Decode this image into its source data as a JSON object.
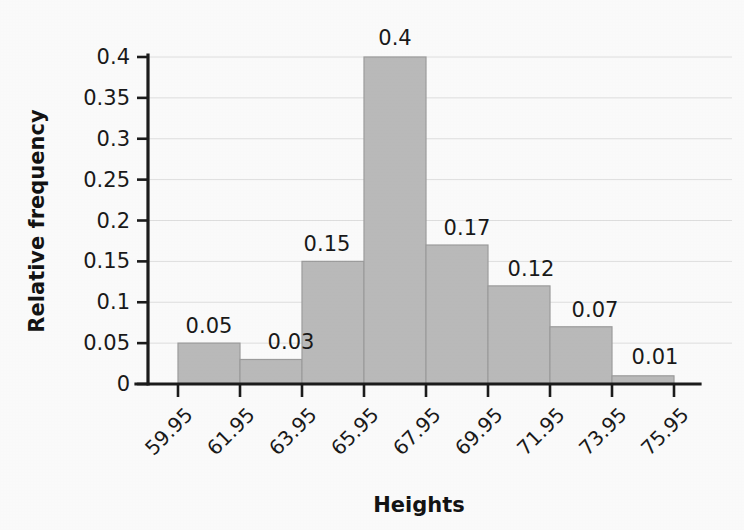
{
  "chart_data": {
    "type": "bar",
    "title": "",
    "xlabel": "Heights",
    "ylabel": "Relative frequency",
    "categories": [
      "59.95-61.95",
      "61.95-63.95",
      "63.95-65.95",
      "65.95-67.95",
      "67.95-69.95",
      "69.95-71.95",
      "71.95-73.95",
      "73.95-75.95"
    ],
    "bin_edges": [
      "59.95",
      "61.95",
      "63.95",
      "65.95",
      "67.95",
      "69.95",
      "71.95",
      "73.95",
      "75.95"
    ],
    "values": [
      0.05,
      0.03,
      0.15,
      0.4,
      0.17,
      0.12,
      0.07,
      0.01
    ],
    "value_labels": [
      "0.05",
      "0.03",
      "0.15",
      "0.4",
      "0.17",
      "0.12",
      "0.07",
      "0.01"
    ],
    "ylim": [
      0,
      0.4
    ],
    "yticks": [
      0,
      0.05,
      0.1,
      0.15,
      0.2,
      0.25,
      0.3,
      0.35,
      0.4
    ],
    "ytick_labels": [
      "0",
      "0.05",
      "0.1",
      "0.15",
      "0.2",
      "0.25",
      "0.3",
      "0.35",
      "0.4"
    ],
    "grid": true,
    "legend": false,
    "bar_color": "#bdbdbd",
    "bar_edge_color": "#9e9e9e",
    "axis_color": "#1c1c1c",
    "grid_color": "#e2e2e2",
    "xtick_rotation": -45
  }
}
